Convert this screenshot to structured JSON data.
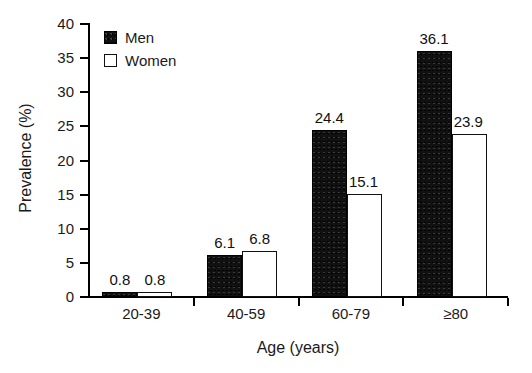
{
  "chart_data": {
    "type": "bar",
    "title": "",
    "categories": [
      "20-39",
      "40-59",
      "60-79",
      "≥80"
    ],
    "series": [
      {
        "name": "Men",
        "values": [
          0.8,
          6.1,
          24.4,
          36.1
        ],
        "color": "#111111"
      },
      {
        "name": "Women",
        "values": [
          0.8,
          6.8,
          15.1,
          23.9
        ],
        "color": "#ffffff"
      }
    ],
    "xlabel": "Age (years)",
    "ylabel": "Prevalence (%)",
    "ylim": [
      0,
      40
    ],
    "ytick_values": [
      "0",
      "5",
      "10",
      "15",
      "20",
      "25",
      "30",
      "35",
      "40"
    ],
    "data_labels": [
      "0.8",
      "0.8",
      "6.1",
      "6.8",
      "24.4",
      "15.1",
      "36.1",
      "23.9"
    ],
    "grid": false,
    "legend_position": "upper-left-inside"
  },
  "legend": {
    "items": [
      {
        "label": "Men",
        "swatch": "filled-black-square"
      },
      {
        "label": "Women",
        "swatch": "open-white-square"
      }
    ]
  },
  "axes": {
    "y_title": "Prevalence (%)",
    "x_title": "Age (years)"
  }
}
